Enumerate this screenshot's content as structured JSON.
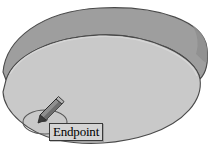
{
  "app": {
    "kind": "cad-viewport",
    "background_color": "#ffffff"
  },
  "viewport": {
    "label": "cad-drawing-viewport",
    "width": 211,
    "height": 152
  },
  "model": {
    "name": "cylindrical-disc",
    "top_face_color": "#c9c9c9",
    "rim_band_color": "#9a9a9a",
    "outline_color": "#4a4a4a",
    "shadow_color": "#b0b0b0"
  },
  "snap": {
    "marker_name": "endpoint-snap-ellipse",
    "marker_color": "#5a5a5a",
    "point_color": "#6b6b6b"
  },
  "cursor": {
    "icon": "pencil-cursor",
    "body_color": "#8a8a8a",
    "tip_color": "#3c3c3c",
    "outline_color": "#2b2b2b"
  },
  "tooltip": {
    "text": "Endpoint",
    "background_color": "#d4d4d4",
    "border_color": "#3a3a3a",
    "text_color": "#000000"
  }
}
